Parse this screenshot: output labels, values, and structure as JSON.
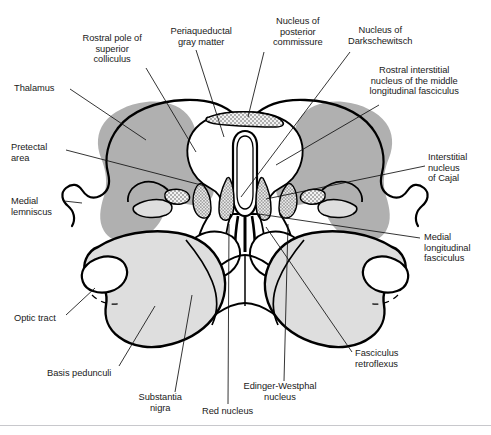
{
  "figure": {
    "type": "labeled-anatomical-diagram",
    "width": 491,
    "height": 435,
    "background_color": "#ffffff",
    "colors": {
      "outline": "#000000",
      "dark_gray_region": "#b0b0b0",
      "light_gray_region": "#dedede",
      "mid_gray_region": "#c9c9c9",
      "stipple": "#f0f0f0",
      "text": "#1a1a1a",
      "leader_line": "#111111",
      "footer_rule": "#c8c8cc"
    }
  },
  "labels": [
    {
      "id": "thalamus",
      "text": "Thalamus",
      "lines": [
        "Thalamus"
      ],
      "align": "left",
      "x": 14,
      "y": 83,
      "leader": {
        "x1": 70,
        "y1": 89,
        "x2": 146,
        "y2": 140
      }
    },
    {
      "id": "rostral-pole-superior-colliculus",
      "text": "Rostral pole of superior colliculus",
      "lines": [
        "Rostral pole of",
        "superior",
        "colliculus"
      ],
      "align": "center",
      "x": 72,
      "y": 33,
      "leader": {
        "x1": 146,
        "y1": 68,
        "x2": 196,
        "y2": 152
      }
    },
    {
      "id": "periaqueductal-gray-matter",
      "text": "Periaqueductal gray matter",
      "lines": [
        "Periaqueductal",
        "gray matter"
      ],
      "align": "center",
      "x": 161,
      "y": 26,
      "leader": {
        "x1": 196,
        "y1": 50,
        "x2": 224,
        "y2": 137
      }
    },
    {
      "id": "nucleus-posterior-commissure",
      "text": "Nucleus of posterior commissure",
      "lines": [
        "Nucleus of",
        "posterior",
        "commissure"
      ],
      "align": "center",
      "x": 258,
      "y": 16,
      "leader": {
        "x1": 264,
        "y1": 52,
        "x2": 248,
        "y2": 117
      }
    },
    {
      "id": "nucleus-of-darkschewitsch",
      "text": "Nucleus of Darkschewitsch",
      "lines": [
        "Nucleus of",
        "Darkschewitsch"
      ],
      "align": "center",
      "x": 340,
      "y": 25,
      "leader": {
        "x1": 350,
        "y1": 52,
        "x2": 241,
        "y2": 197
      }
    },
    {
      "id": "rostral-interstitial-nucleus-mlf",
      "text": "Rostral interstitial nucleus of the middle longitudinal fasciculus",
      "lines": [
        "Rostral interstitial",
        "nucleus of the middle",
        "longitudinal fasciculus"
      ],
      "align": "center",
      "x": 374,
      "y": 65,
      "leader": {
        "x1": 379,
        "y1": 105,
        "x2": 276,
        "y2": 165
      }
    },
    {
      "id": "pretectal-area",
      "text": "Pretectal area",
      "lines": [
        "Pretectal",
        "area"
      ],
      "align": "left",
      "x": 11,
      "y": 142,
      "leader": {
        "x1": 66,
        "y1": 150,
        "x2": 205,
        "y2": 186
      }
    },
    {
      "id": "interstitial-nucleus-of-cajal",
      "text": "Interstitial nucleus of Cajal",
      "lines": [
        "Interstitial",
        "nucleus",
        "of Cajal"
      ],
      "align": "left",
      "x": 428,
      "y": 152,
      "leader": {
        "x1": 425,
        "y1": 166,
        "x2": 266,
        "y2": 199
      }
    },
    {
      "id": "medial-lemniscus",
      "text": "Medial lemniscus",
      "lines": [
        "Medial",
        "lemniscus"
      ],
      "align": "left",
      "x": 11,
      "y": 196,
      "leader": {
        "x1": 64,
        "y1": 201,
        "x2": 82,
        "y2": 203
      }
    },
    {
      "id": "medial-longitudinal-fasciculus",
      "text": "Medial longitudinal fasciculus",
      "lines": [
        "Medial",
        "longitudinal",
        "fasciculus"
      ],
      "align": "left",
      "x": 424,
      "y": 232,
      "leader": {
        "x1": 420,
        "y1": 238,
        "x2": 252,
        "y2": 213
      }
    },
    {
      "id": "optic-tract",
      "text": "Optic tract",
      "lines": [
        "Optic tract"
      ],
      "align": "left",
      "x": 14,
      "y": 313,
      "leader": {
        "x1": 66,
        "y1": 315,
        "x2": 95,
        "y2": 288
      }
    },
    {
      "id": "basis-pedunculi",
      "text": "Basis pedunculi",
      "lines": [
        "Basis pedunculi"
      ],
      "align": "left",
      "x": 47,
      "y": 368,
      "leader": {
        "x1": 119,
        "y1": 366,
        "x2": 155,
        "y2": 306
      }
    },
    {
      "id": "substantia-nigra",
      "text": "Substantia nigra",
      "lines": [
        "Substantia",
        "nigra"
      ],
      "align": "center",
      "x": 120,
      "y": 392,
      "leader": {
        "x1": 175,
        "y1": 392,
        "x2": 192,
        "y2": 295
      }
    },
    {
      "id": "red-nucleus",
      "text": "Red nucleus",
      "lines": [
        "Red nucleus"
      ],
      "align": "left",
      "x": 202,
      "y": 406,
      "leader": {
        "x1": 228,
        "y1": 404,
        "x2": 229,
        "y2": 224
      }
    },
    {
      "id": "edinger-westphal-nucleus",
      "text": "Edinger-Westphal nucleus",
      "lines": [
        "Edinger-Westphal",
        "nucleus"
      ],
      "align": "center",
      "x": 240,
      "y": 381,
      "leader": {
        "x1": 284,
        "y1": 381,
        "x2": 288,
        "y2": 224
      }
    },
    {
      "id": "fasciculus-retroflexus",
      "text": "Fasciculus retroflexus",
      "lines": [
        "Fasciculus",
        "retroflexus"
      ],
      "align": "left",
      "x": 355,
      "y": 348,
      "leader": {
        "x1": 352,
        "y1": 352,
        "x2": 266,
        "y2": 227
      }
    }
  ],
  "footer": {
    "caption": ""
  }
}
